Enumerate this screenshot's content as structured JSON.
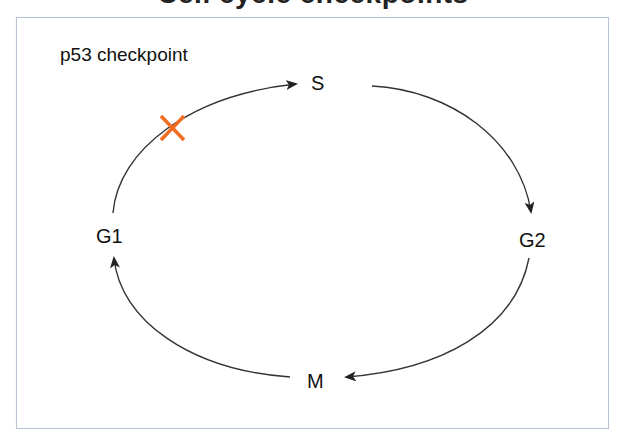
{
  "header": {
    "title_partial": "Cell cycle checkpoints"
  },
  "diagram": {
    "type": "cell-cycle",
    "checkpoint_label": "p53 checkpoint",
    "phases": [
      {
        "id": "S",
        "label": "S"
      },
      {
        "id": "G2",
        "label": "G2"
      },
      {
        "id": "M",
        "label": "M"
      },
      {
        "id": "G1",
        "label": "G1"
      }
    ],
    "transitions": [
      {
        "from": "G1",
        "to": "S",
        "blocked": true
      },
      {
        "from": "S",
        "to": "G2",
        "blocked": false
      },
      {
        "from": "G2",
        "to": "M",
        "blocked": false
      },
      {
        "from": "M",
        "to": "G1",
        "blocked": false
      }
    ],
    "block_marker": {
      "icon": "x-mark-icon",
      "color": "#F26C22",
      "on_transition": "G1 -> S"
    },
    "colors": {
      "arrow": "#222222",
      "frame_border": "#b8c4d4",
      "text": "#111111"
    }
  }
}
